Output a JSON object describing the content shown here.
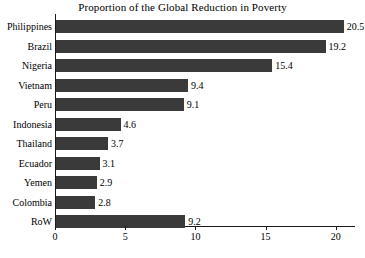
{
  "chart_data": {
    "type": "bar",
    "orientation": "horizontal",
    "title": "Proportion of the Global Reduction in Poverty",
    "xlabel": "",
    "ylabel": "",
    "categories": [
      "Philippines",
      "Brazil",
      "Nigeria",
      "Vietnam",
      "Peru",
      "Indonesia",
      "Thailand",
      "Ecuador",
      "Yemen",
      "Colombia",
      "RoW"
    ],
    "values": [
      20.5,
      19.2,
      15.4,
      9.4,
      9.1,
      4.6,
      3.7,
      3.1,
      2.9,
      2.8,
      9.2
    ],
    "value_labels": [
      "20.5",
      "19.2",
      "15.4",
      "9.4",
      "9.1",
      "4.6",
      "3.7",
      "3.1",
      "2.9",
      "2.8",
      "9.2"
    ],
    "xlim": [
      0,
      21.3
    ],
    "xticks": [
      0,
      5,
      10,
      15,
      20
    ],
    "xtick_labels": [
      "0",
      "5",
      "10",
      "15",
      "20"
    ],
    "grid": false,
    "legend": null,
    "bar_color": "#3a3a3a",
    "axis_color": "#1a1a1a",
    "background": "#ffffff"
  }
}
